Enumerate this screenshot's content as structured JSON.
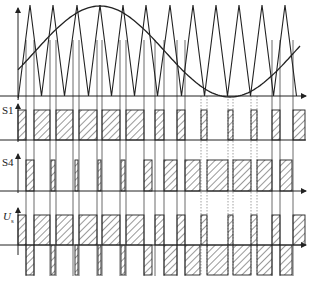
{
  "diagram": {
    "labels": {
      "s1": "S1",
      "s4": "S4",
      "us_main": "U",
      "us_sub": "s"
    },
    "colors": {
      "line": "#222222",
      "grid": "#444444",
      "dotted": "#888888",
      "background": "#ffffff"
    },
    "carrier": {
      "type": "triangle",
      "peaks_x": [
        30,
        53,
        77,
        100,
        123,
        146,
        170,
        193,
        216,
        239,
        262,
        285
      ],
      "top_y": 5,
      "bottom_y": 96
    },
    "reference": {
      "type": "sine",
      "start_y": 52,
      "max_x": 100,
      "max_y": 6,
      "min_x": 230,
      "min_y": 97
    },
    "s1_pulses": [
      [
        18,
        26
      ],
      [
        34,
        50
      ],
      [
        56,
        73
      ],
      [
        79,
        97
      ],
      [
        102,
        120
      ],
      [
        126,
        144
      ],
      [
        155,
        164
      ],
      [
        177,
        185
      ],
      [
        201,
        207
      ],
      [
        228,
        233
      ],
      [
        251,
        257
      ],
      [
        272,
        280
      ],
      [
        293,
        305
      ]
    ],
    "s4_pulses": [
      [
        26,
        34
      ],
      [
        51,
        55
      ],
      [
        75,
        78
      ],
      [
        98,
        101
      ],
      [
        121,
        125
      ],
      [
        144,
        152
      ],
      [
        164,
        177
      ],
      [
        185,
        200
      ],
      [
        207,
        228
      ],
      [
        233,
        251
      ],
      [
        257,
        272
      ],
      [
        280,
        292
      ]
    ],
    "us_positive": [
      [
        18,
        26
      ],
      [
        34,
        50
      ],
      [
        56,
        73
      ],
      [
        79,
        97
      ],
      [
        102,
        120
      ],
      [
        126,
        144
      ],
      [
        155,
        164
      ],
      [
        177,
        185
      ],
      [
        201,
        207
      ],
      [
        228,
        233
      ],
      [
        251,
        257
      ],
      [
        272,
        280
      ],
      [
        293,
        305
      ]
    ],
    "us_negative": [
      [
        26,
        34
      ],
      [
        51,
        55
      ],
      [
        75,
        78
      ],
      [
        98,
        101
      ],
      [
        121,
        125
      ],
      [
        144,
        152
      ],
      [
        164,
        177
      ],
      [
        185,
        200
      ],
      [
        207,
        228
      ],
      [
        233,
        251
      ],
      [
        257,
        272
      ],
      [
        280,
        292
      ]
    ],
    "switch_lines_x": [
      26,
      34,
      50,
      56,
      73,
      79,
      97,
      102,
      120,
      126,
      144,
      155,
      164,
      177,
      185,
      201,
      207,
      228,
      233,
      251,
      257,
      272,
      280,
      293
    ],
    "dotted_lines_x": [
      201,
      207,
      228,
      233,
      251,
      257
    ]
  }
}
